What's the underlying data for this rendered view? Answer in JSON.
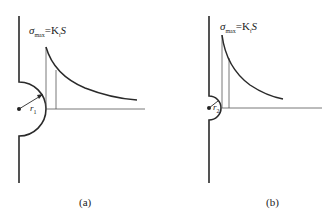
{
  "figures": [
    {
      "id": "a",
      "caption": "(a)",
      "equation": {
        "sigma": "σ",
        "sub": "max",
        "rest": "=K",
        "t": "t",
        "s": "S"
      },
      "radius_label": {
        "r": "r",
        "sub": "1"
      }
    },
    {
      "id": "b",
      "caption": "(b)",
      "equation": {
        "sigma": "σ",
        "sub": "max",
        "rest": "=K",
        "t": "t",
        "s": "S"
      },
      "radius_label": {
        "r": "r",
        "sub": "2"
      }
    }
  ],
  "colors": {
    "line": "#2a2a2a",
    "thin": "#555555",
    "background": "#ffffff"
  }
}
